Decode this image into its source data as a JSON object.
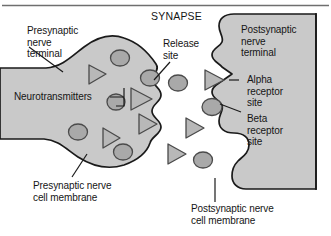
{
  "figure": {
    "title": "SYNAPSE",
    "background_color": "#ffffff",
    "rule_color": "#6f6f6f",
    "outline_color": "#1a1a1a",
    "cell_fill_color": "#c9c9c9",
    "vesicle_fill_color": "#a9a9a9",
    "transmitter_fill_color": "#b8b8b8",
    "text_color": "#151515"
  },
  "labels": {
    "presynaptic_terminal": "Presynaptic\nnerve\nterminal",
    "neurotransmitters": "Neurotransmitters",
    "presynaptic_membrane": "Presynaptic nerve\ncell membrane",
    "release_site": "Release\nsite",
    "postsynaptic_terminal": "Postsynaptic\nnerve\nterminal",
    "alpha_receptor": "Alpha\nreceptor\nsite",
    "beta_receptor": "Beta\nreceptor\nsite",
    "postsynaptic_membrane": "Postsynaptic nerve\ncell membrane"
  },
  "structures": {
    "presynaptic_terminal_name": "presynaptic-nerve-terminal",
    "postsynaptic_terminal_name": "postsynaptic-nerve-terminal",
    "synaptic_cleft_name": "synaptic-cleft",
    "release_site_name": "release-site-vesicle",
    "alpha_receptor_name": "alpha-receptor-notch",
    "beta_receptor_name": "beta-receptor-notch"
  },
  "counts": {
    "presynaptic_vesicles": 6,
    "presynaptic_transmitters": 5,
    "cleft_transmitters": 2,
    "cleft_vesicles": 2,
    "bound_transmitters": 1,
    "bound_vesicles": 1
  }
}
